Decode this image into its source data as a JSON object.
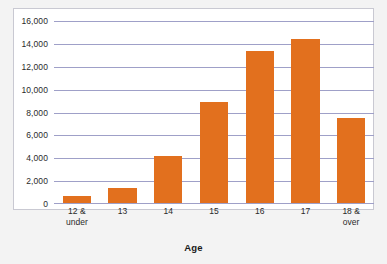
{
  "chart_data": {
    "type": "bar",
    "title": "",
    "xlabel": "Age",
    "ylabel": "",
    "categories": [
      "12 &\nunder",
      "13",
      "14",
      "15",
      "16",
      "17",
      "18 &\nover"
    ],
    "values": [
      600,
      1300,
      4100,
      8800,
      13300,
      14300,
      7400
    ],
    "ylim": [
      0,
      16000
    ],
    "ytick_labels": [
      "16,000",
      "14,000",
      "12,000",
      "10,000",
      "8,000",
      "6,000",
      "4,000",
      "2,000",
      "0"
    ],
    "ytick_values": [
      16000,
      14000,
      12000,
      10000,
      8000,
      6000,
      4000,
      2000,
      0
    ],
    "grid": true,
    "legend": "none",
    "bar_color": "#e2701e",
    "gridline_color": "#9fa0c8",
    "plot_background": "#ffffff",
    "figure_background": "#f3f3f3",
    "border_color": "#c9c9d2"
  }
}
